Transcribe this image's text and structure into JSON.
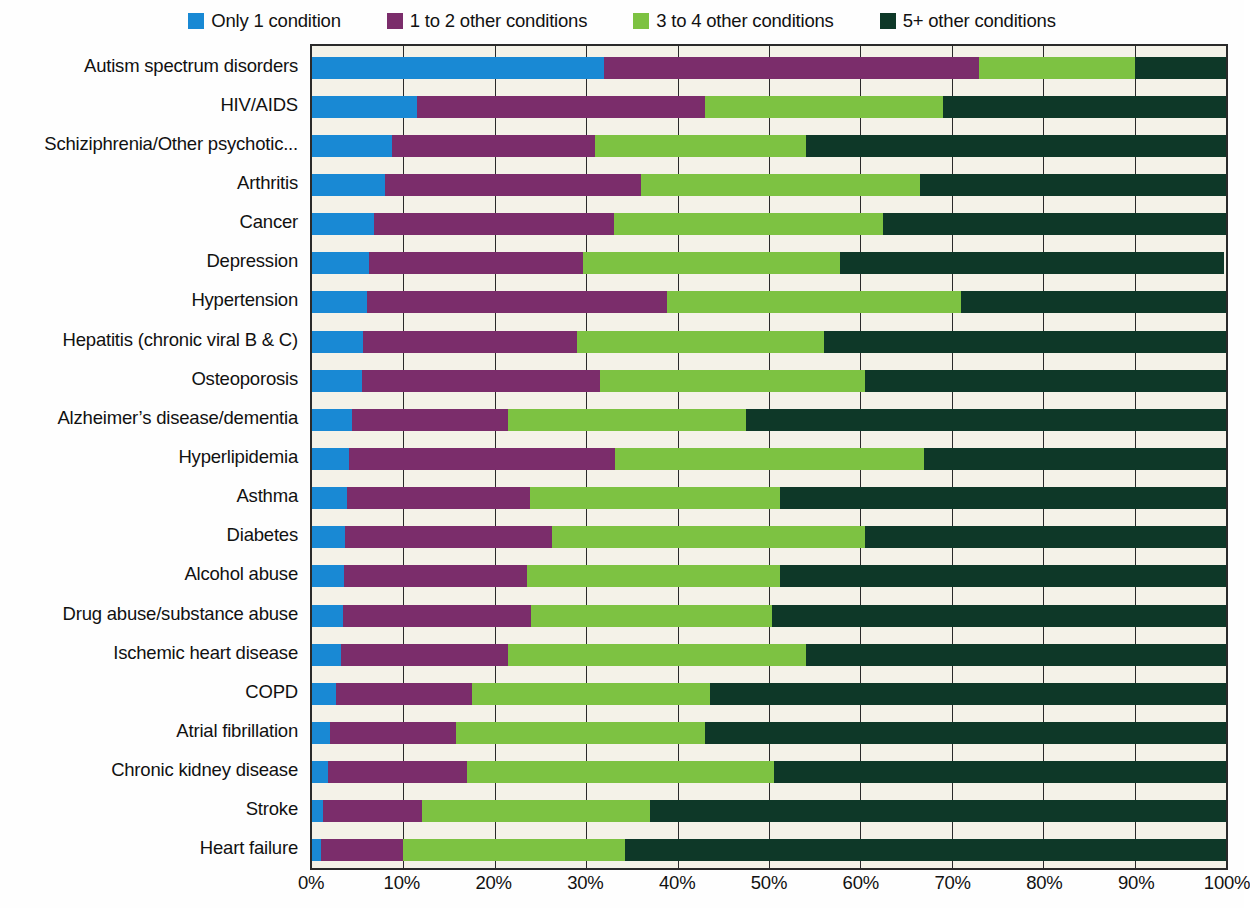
{
  "legend": {
    "items": [
      {
        "label": "Only 1 condition",
        "color": "#1989d4",
        "key": "only1"
      },
      {
        "label": "1 to 2 other conditions",
        "color": "#7b2d6b",
        "key": "one_to_two"
      },
      {
        "label": "3 to 4 other conditions",
        "color": "#7dc242",
        "key": "three_to_four"
      },
      {
        "label": "5+ other conditions",
        "color": "#0e3828",
        "key": "five_plus"
      }
    ]
  },
  "axis": {
    "x_ticks": [
      "0%",
      "10%",
      "20%",
      "30%",
      "40%",
      "50%",
      "60%",
      "70%",
      "80%",
      "90%",
      "100%"
    ]
  },
  "chart_data": {
    "type": "bar",
    "orientation": "horizontal",
    "stacked": true,
    "normalized_percent": true,
    "title": "",
    "xlabel": "",
    "ylabel": "",
    "xlim": [
      0,
      100
    ],
    "grid": true,
    "legend_position": "top",
    "series": [
      {
        "name": "Only 1 condition",
        "color": "#1989d4",
        "values": [
          32.0,
          11.5,
          8.7,
          8.0,
          6.8,
          6.2,
          6.0,
          5.6,
          5.5,
          4.4,
          4.0,
          3.8,
          3.6,
          3.5,
          3.4,
          3.2,
          2.6,
          2.0,
          1.8,
          1.2,
          1.0
        ]
      },
      {
        "name": "1 to 2 other conditions",
        "color": "#7b2d6b",
        "values": [
          41.0,
          31.5,
          22.3,
          28.0,
          26.2,
          23.5,
          32.8,
          23.4,
          26.0,
          17.1,
          29.2,
          20.0,
          22.7,
          20.0,
          20.6,
          18.3,
          14.9,
          13.8,
          15.2,
          10.8,
          9.0
        ]
      },
      {
        "name": "3 to 4 other conditions",
        "color": "#7dc242",
        "values": [
          17.0,
          26.0,
          23.0,
          30.5,
          29.5,
          28.1,
          32.2,
          27.0,
          29.0,
          26.0,
          33.8,
          27.4,
          34.2,
          27.7,
          26.3,
          32.5,
          26.0,
          27.2,
          33.5,
          25.0,
          24.3
        ]
      },
      {
        "name": "5+ other conditions",
        "color": "#0e3828",
        "values": [
          10.0,
          31.0,
          46.0,
          33.5,
          37.5,
          42.0,
          29.0,
          44.0,
          39.5,
          52.5,
          33.0,
          48.8,
          39.5,
          48.8,
          49.7,
          46.0,
          56.5,
          57.0,
          49.5,
          63.0,
          65.7
        ]
      }
    ],
    "categories": [
      "Autism spectrum disorders",
      "HIV/AIDS",
      "Schiziphrenia/Other psychotic...",
      "Arthritis",
      "Cancer",
      "Depression",
      "Hypertension",
      "Hepatitis (chronic viral B & C)",
      "Osteoporosis",
      "Alzheimer’s disease/dementia",
      "Hyperlipidemia",
      "Asthma",
      "Diabetes",
      "Alcohol abuse",
      "Drug abuse/substance abuse",
      "Ischemic heart disease",
      "COPD",
      "Atrial fibrillation",
      "Chronic kidney disease",
      "Stroke",
      "Heart failure"
    ]
  }
}
